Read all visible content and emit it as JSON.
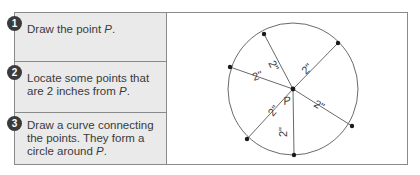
{
  "steps": [
    {
      "number": "1",
      "text": "Draw the point ",
      "var": "P",
      "suffix": "."
    },
    {
      "number": "2",
      "text": "Locate some points that are 2 inches from ",
      "var": "P",
      "suffix": "."
    },
    {
      "number": "3",
      "text": "Draw a curve connecting the points. They form a circle around ",
      "var": "P",
      "suffix": "."
    }
  ],
  "diagram": {
    "center_label": "P",
    "radius_label": "2\"",
    "line_color": "#6a6a6a",
    "point_color": "#1a1a1a",
    "points_count": 6
  }
}
